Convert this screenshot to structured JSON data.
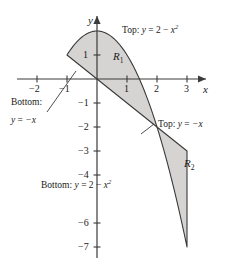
{
  "figure": {
    "background_color": "#ffffff",
    "line_color": "#3a3a3a",
    "fill_color": "#d6d3d3",
    "text_color": "#1a1a1a"
  },
  "axes": {
    "x_axis_name": "x",
    "y_axis_name": "y",
    "origin_px": {
      "x": 97,
      "y": 79
    },
    "x_unit_px": 30,
    "y_unit_px": 24,
    "x_ticks": [
      {
        "value": -2,
        "label": "−2"
      },
      {
        "value": -1,
        "label": "−1"
      },
      {
        "value": 1,
        "label": "1"
      },
      {
        "value": 2,
        "label": "2"
      },
      {
        "value": 3,
        "label": "3"
      }
    ],
    "y_ticks": [
      {
        "value": 1,
        "label": "1"
      },
      {
        "value": -1,
        "label": "−1"
      },
      {
        "value": -2,
        "label": "−2"
      },
      {
        "value": -3,
        "label": "−3"
      },
      {
        "value": -4,
        "label": "−4"
      },
      {
        "value": -6,
        "label": "−6"
      },
      {
        "value": -7,
        "label": "−7"
      }
    ],
    "x_range": [
      -2.6,
      4.0
    ],
    "y_range": [
      -7.8,
      3.0
    ]
  },
  "regions": [
    {
      "id": "R1",
      "name": "R",
      "subscript": "1",
      "top_curve": "y = 2 − x²",
      "bottom_curve": "y = −x",
      "x_from": -1,
      "x_to": 2,
      "label_px": {
        "x": 117,
        "y": 57
      }
    },
    {
      "id": "R2",
      "name": "R",
      "subscript": "2",
      "top_curve": "y = −x",
      "bottom_curve": "y = 2 − x²",
      "x_from": 2,
      "x_to": 3,
      "label_px": {
        "x": 188,
        "y": 164
      }
    }
  ],
  "curves": [
    {
      "id": "parabola",
      "equation": "y = 2 - x^2",
      "display": "y = 2 − x²"
    },
    {
      "id": "line",
      "equation": "y = -x",
      "display": "y = −x"
    }
  ],
  "callouts": [
    {
      "id": "top-parabola",
      "keyword": "Top:",
      "lhs": "y",
      "rel": "=",
      "rhs_pre": "2 − ",
      "rhs_var": "x",
      "rhs_sup": "2",
      "full_text": "Top: y = 2 − x²",
      "px": {
        "x": 123,
        "y": 31
      }
    },
    {
      "id": "bottom-line",
      "keyword": "Bottom:",
      "line2_lhs": "y",
      "line2_rel": "=",
      "line2_rhs": "−x",
      "full_text": "Bottom: y = −x",
      "px": {
        "x": 13,
        "y": 103
      }
    },
    {
      "id": "top-line",
      "keyword": "Top:",
      "lhs": "y",
      "rel": "=",
      "rhs": "−x",
      "full_text": "Top: y = −x",
      "px": {
        "x": 157,
        "y": 125
      }
    },
    {
      "id": "bottom-parabola",
      "keyword": "Bottom:",
      "lhs": "y",
      "rel": "=",
      "rhs_pre": "2 − ",
      "rhs_var": "x",
      "rhs_sup": "2",
      "full_text": "Bottom: y = 2 − x²",
      "px": {
        "x": 42,
        "y": 186
      }
    }
  ],
  "tick_text": {
    "x_m2": "−2",
    "x_m1": "−1",
    "x_1": "1",
    "x_2": "2",
    "x_3": "3",
    "y_1": "1",
    "y_m1": "−1",
    "y_m2": "−2",
    "y_m3": "−3",
    "y_m4": "−4",
    "y_m6": "−6",
    "y_m7": "−7"
  },
  "callout_text": {
    "top_kw": "Top:",
    "bottom_kw": "Bottom:",
    "y_eq": "y",
    "equals": "=",
    "two_minus": "2 − ",
    "x_var": "x",
    "sup_two": "2",
    "neg_x": "−x"
  },
  "axis_names": {
    "x": "x",
    "y": "y"
  },
  "region_text": {
    "r": "R",
    "one": "1",
    "two": "2"
  }
}
